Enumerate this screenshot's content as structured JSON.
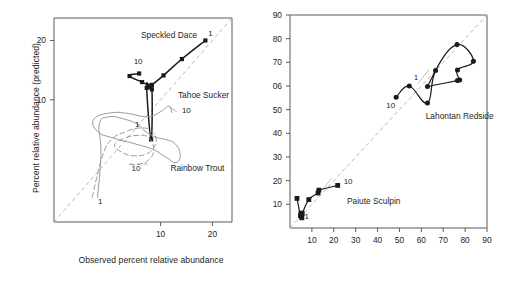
{
  "figure": {
    "background_color": "#ffffff",
    "frame_color": "#5a5a5a",
    "identity_line_color": "#b8b8b8"
  },
  "panels": {
    "left": {
      "name": "left-panel",
      "xlabel": "Observed percent relative abundance",
      "ylabel": "Percent relative abundance (predicted)",
      "scale": "log",
      "x_ticks": [
        "10",
        "20"
      ],
      "y_ticks": [
        "10",
        "20"
      ],
      "xlim": [
        2.4,
        26
      ],
      "ylim": [
        2.4,
        26
      ],
      "identity_line": true
    },
    "right": {
      "name": "right-panel",
      "xlabel": "Observed percent relative abundance",
      "ylabel": "",
      "scale": "linear",
      "x_ticks": [
        "10",
        "20",
        "30",
        "40",
        "50",
        "60",
        "70",
        "80",
        "90"
      ],
      "y_ticks": [
        "10",
        "20",
        "30",
        "40",
        "50",
        "06",
        "70",
        "80",
        "90"
      ],
      "xlim": [
        0,
        90
      ],
      "ylim": [
        0,
        90
      ],
      "identity_line": true
    }
  },
  "chart_data": {
    "type": "scatter",
    "title": "",
    "xlabel": "Observed percent relative abundance",
    "ylabel": "Percent relative abundance (predicted)",
    "grid": false,
    "legend_position": "inline-annotations",
    "panels": [
      {
        "panel": "left",
        "scale": "log",
        "xlim": [
          2.4,
          26
        ],
        "ylim": [
          2.4,
          26
        ],
        "xticks": [
          10,
          20
        ],
        "yticks": [
          10,
          20
        ],
        "series": [
          {
            "name": "Speckled Dace",
            "color": "#1a1a1a",
            "linestyle": "solid",
            "marker": "square",
            "label_x": 10.6,
            "label_y": 20.6,
            "start_label": "1",
            "end_label": "10",
            "points": [
              [
                18.2,
                20.0
              ],
              [
                13.3,
                16.1
              ],
              [
                10.4,
                13.3
              ],
              [
                8.9,
                11.9
              ],
              [
                8.6,
                11.6
              ],
              [
                8.3,
                11.5
              ],
              [
                8.8,
                6.3
              ],
              [
                8.9,
                11.3
              ],
              [
                8.5,
                11.8
              ],
              [
                7.8,
                12.3
              ],
              [
                6.6,
                13.2
              ],
              [
                7.5,
                13.6
              ]
            ]
          },
          {
            "name": "Tahoe Sucker",
            "color": "#9a9a9a",
            "linestyle": "solid",
            "marker": "none",
            "label_x": 12.8,
            "label_y": 10.1,
            "start_label": "1",
            "end_label": "10",
            "points": [
              [
                4.3,
                3.2
              ],
              [
                4.5,
                5.4
              ],
              [
                4.4,
                7.5
              ],
              [
                5.0,
                8.2
              ],
              [
                6.1,
                8.0
              ],
              [
                7.4,
                7.5
              ],
              [
                8.0,
                7.0
              ],
              [
                9.2,
                6.5
              ],
              [
                10.6,
                6.3
              ],
              [
                12.1,
                6.0
              ],
              [
                13.0,
                5.3
              ],
              [
                12.3,
                4.8
              ],
              [
                10.8,
                5.1
              ],
              [
                9.0,
                5.6
              ],
              [
                7.0,
                6.0
              ],
              [
                5.3,
                6.4
              ],
              [
                4.3,
                6.9
              ],
              [
                4.1,
                8.0
              ],
              [
                5.2,
                8.6
              ],
              [
                6.6,
                8.5
              ],
              [
                8.4,
                8.2
              ],
              [
                10.0,
                8.7
              ],
              [
                11.2,
                9.3
              ],
              [
                11.6,
                8.6
              ]
            ]
          },
          {
            "name": "Rainbow Trout",
            "color": "#9a9a9a",
            "linestyle": "dashed",
            "marker": "none",
            "label_x": 12.0,
            "label_y": 4.4,
            "start_label": "1",
            "end_label": "10",
            "points": [
              [
                4.0,
                3.2
              ],
              [
                4.6,
                5.2
              ],
              [
                5.2,
                6.3
              ],
              [
                6.3,
                6.9
              ],
              [
                7.6,
                7.2
              ],
              [
                8.7,
                7.0
              ],
              [
                9.4,
                6.4
              ],
              [
                9.1,
                5.7
              ],
              [
                8.2,
                5.3
              ],
              [
                7.0,
                5.2
              ],
              [
                6.0,
                5.4
              ],
              [
                5.4,
                5.9
              ],
              [
                6.2,
                6.4
              ],
              [
                7.4,
                6.6
              ],
              [
                8.6,
                6.4
              ],
              [
                9.1,
                5.5
              ],
              [
                8.4,
                4.9
              ],
              [
                7.4,
                4.7
              ],
              [
                6.6,
                4.7
              ]
            ]
          }
        ]
      },
      {
        "panel": "right",
        "scale": "linear",
        "xlim": [
          0,
          90
        ],
        "ylim": [
          0,
          90
        ],
        "xticks": [
          10,
          20,
          30,
          40,
          50,
          60,
          70,
          80,
          90
        ],
        "yticks": [
          10,
          20,
          30,
          40,
          50,
          60,
          70,
          80,
          90
        ],
        "series": [
          {
            "name": "Lahontan Redside",
            "color": "#1a1a1a",
            "linestyle": "solid",
            "marker": "circle",
            "label_x": 62,
            "label_y": 46,
            "start_label": "1",
            "end_label": "10",
            "points": [
              [
                48.5,
                55.2
              ],
              [
                54.5,
                60.0
              ],
              [
                62.8,
                52.8
              ],
              [
                66.5,
                66.5
              ],
              [
                76.3,
                77.5
              ],
              [
                83.8,
                70.5
              ],
              [
                76.5,
                66.8
              ],
              [
                77.5,
                62.5
              ],
              [
                76.5,
                62.3
              ],
              [
                62.8,
                59.8
              ]
            ]
          },
          {
            "name": "Paiute Sculpin",
            "color": "#1a1a1a",
            "linestyle": "solid",
            "marker": "square",
            "label_x": 26,
            "label_y": 10,
            "start_label": "1",
            "end_label": "10",
            "points": [
              [
                3.2,
                12.5
              ],
              [
                4.8,
                5.2
              ],
              [
                5.0,
                6.3
              ],
              [
                5.2,
                5.0
              ],
              [
                5.4,
                4.3
              ],
              [
                5.6,
                6.0
              ],
              [
                8.6,
                12.0
              ],
              [
                12.8,
                14.8
              ],
              [
                13.2,
                16.0
              ],
              [
                21.8,
                18.0
              ]
            ]
          }
        ]
      }
    ]
  },
  "annotations": {
    "left": [
      {
        "text": "Speckled Dace",
        "name": "label-speckled-dace"
      },
      {
        "text": "Tahoe Sucker",
        "name": "label-tahoe-sucker"
      },
      {
        "text": "Rainbow Trout",
        "name": "label-rainbow-trout"
      },
      {
        "text": "1",
        "name": "point-label-dace-1"
      },
      {
        "text": "10",
        "name": "point-label-dace-10"
      },
      {
        "text": "1",
        "name": "point-label-sucker-1"
      },
      {
        "text": "10",
        "name": "point-label-sucker-10"
      },
      {
        "text": "1",
        "name": "point-label-trout-1"
      },
      {
        "text": "10",
        "name": "point-label-trout-10"
      }
    ],
    "right": [
      {
        "text": "Lahontan Redside",
        "name": "label-lahontan-redside"
      },
      {
        "text": "Paiute Sculpin",
        "name": "label-paiute-sculpin"
      },
      {
        "text": "1",
        "name": "point-label-redside-1"
      },
      {
        "text": "10",
        "name": "point-label-redside-10"
      },
      {
        "text": "1",
        "name": "point-label-sculpin-1"
      },
      {
        "text": "10",
        "name": "point-label-sculpin-10"
      }
    ]
  }
}
